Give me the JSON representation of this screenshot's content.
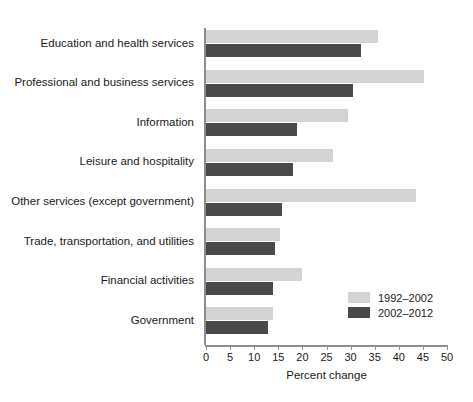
{
  "chart_data": {
    "type": "bar",
    "orientation": "horizontal",
    "title": "",
    "xlabel": "Percent change",
    "ylabel": "",
    "xlim": [
      0,
      50
    ],
    "xticks": [
      0,
      5,
      10,
      15,
      20,
      25,
      30,
      35,
      40,
      45,
      50
    ],
    "xtick_labels": [
      "0",
      "5",
      "10",
      "15",
      "20",
      "25",
      "30",
      "35",
      "40",
      "45",
      "50"
    ],
    "grid": false,
    "legend_position": "bottom-right",
    "categories": [
      "Education and health services",
      "Professional and business services",
      "Information",
      "Leisure and hospitality",
      "Other services (except government)",
      "Trade, transportation, and utilities",
      "Financial activities",
      "Government"
    ],
    "series": [
      {
        "name": "1992–2002",
        "color": "#d4d4d4",
        "values": [
          35.7,
          45.2,
          29.5,
          26.3,
          43.6,
          15.3,
          19.9,
          14.0
        ]
      },
      {
        "name": "2002–2012",
        "color": "#4a4a4a",
        "values": [
          32.1,
          30.5,
          18.9,
          18.0,
          15.8,
          14.3,
          13.9,
          12.8
        ]
      }
    ]
  },
  "axis": {
    "line_color": "#8d8d8d"
  }
}
